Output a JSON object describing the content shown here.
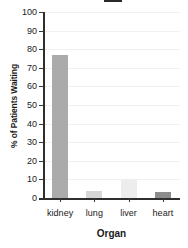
{
  "chart_data": {
    "type": "bar",
    "title": "",
    "title_cropped": true,
    "categories": [
      "kidney",
      "lung",
      "liver",
      "heart"
    ],
    "values": [
      77,
      4,
      10,
      3
    ],
    "series": [
      {
        "name": "% of Patients Waiting",
        "values": [
          77,
          4,
          10,
          3
        ]
      }
    ],
    "xlabel": "Organ",
    "ylabel": "% of Patients Waiting",
    "ylim": [
      0,
      100
    ],
    "yticks": [
      0,
      10,
      20,
      30,
      40,
      50,
      60,
      70,
      80,
      90,
      100
    ],
    "ytick_labels": [
      "0",
      "10",
      "20",
      "30",
      "40",
      "50",
      "60",
      "70",
      "80",
      "90",
      "100"
    ],
    "grid": true,
    "grid_axis": "y",
    "legend": false,
    "bar_colors": [
      "#ababab",
      "#d6d6d6",
      "#ededed",
      "#8c8c8c"
    ],
    "colors": {
      "axis": "#2e2e2e",
      "grid": "#f1f1f1",
      "text": "#1a1a1a",
      "background": "#ffffff"
    }
  }
}
